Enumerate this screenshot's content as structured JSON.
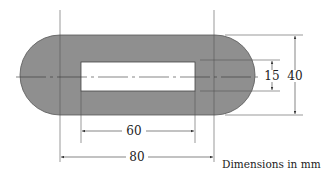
{
  "diagram": {
    "colors": {
      "body_fill": "#8f8f8f",
      "body_stroke": "#555555",
      "slot_fill": "#ffffff",
      "line": "#444444"
    },
    "dimensions": {
      "slot_length": "60",
      "center_distance": "80",
      "slot_width": "15",
      "plate_height": "40"
    },
    "note": "Dimensions in mm"
  }
}
